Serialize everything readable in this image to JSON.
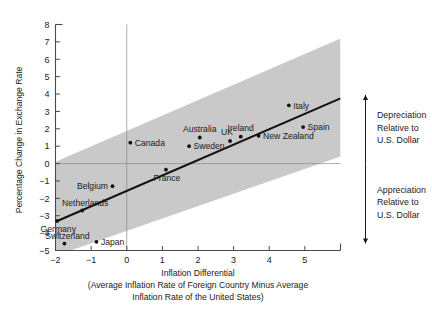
{
  "chart_data": {
    "type": "scatter",
    "title": "",
    "xlabel": "Inflation Differential",
    "xlabel_sub_line1": "(Average Inflation Rate of Foreign Country Minus Average",
    "xlabel_sub_line2": "Inflation Rate of the United States)",
    "ylabel": "Percentage Change in Exchange Rate",
    "xlim": [
      -2,
      6
    ],
    "ylim": [
      -5,
      8
    ],
    "xticks": [
      -2,
      -1,
      0,
      1,
      2,
      3,
      4,
      5
    ],
    "xtick_labels": [
      "−2",
      "−1",
      "0",
      "1",
      "2",
      "3",
      "4",
      "5"
    ],
    "yticks": [
      -5,
      -4,
      -3,
      -2,
      -1,
      0,
      1,
      2,
      3,
      4,
      5,
      6,
      7,
      8
    ],
    "ytick_labels": [
      "−5",
      "−4",
      "−3",
      "−2",
      "−1",
      "0",
      "1",
      "2",
      "3",
      "4",
      "5",
      "6",
      "7",
      "8"
    ],
    "grid": false,
    "zero_lines": true,
    "points": [
      {
        "label": "Canada",
        "x": 0.1,
        "y": 1.2,
        "label_pos": "right"
      },
      {
        "label": "Australia",
        "x": 2.05,
        "y": 1.5,
        "label_pos": "above"
      },
      {
        "label": "Sweden",
        "x": 1.75,
        "y": 1.0,
        "label_pos": "right"
      },
      {
        "label": "UK",
        "x": 2.9,
        "y": 1.3,
        "label_pos": "above-left"
      },
      {
        "label": "Ireland",
        "x": 3.2,
        "y": 1.55,
        "label_pos": "above"
      },
      {
        "label": "New Zealand",
        "x": 3.7,
        "y": 1.6,
        "label_pos": "right"
      },
      {
        "label": "Spain",
        "x": 4.95,
        "y": 2.1,
        "label_pos": "right"
      },
      {
        "label": "Italy",
        "x": 4.55,
        "y": 3.35,
        "label_pos": "right"
      },
      {
        "label": "France",
        "x": 1.1,
        "y": -0.35,
        "label_pos": "below-right"
      },
      {
        "label": "Belgium",
        "x": -0.4,
        "y": -1.3,
        "label_pos": "left"
      },
      {
        "label": "Netherlands",
        "x": -1.25,
        "y": -2.7,
        "label_pos": "above-right"
      },
      {
        "label": "Germany",
        "x": -1.95,
        "y": -3.3,
        "label_pos": "below-right"
      },
      {
        "label": "Switzerland",
        "x": -1.75,
        "y": -4.6,
        "label_pos": "above-right"
      },
      {
        "label": "Japan",
        "x": -0.85,
        "y": -4.5,
        "label_pos": "right"
      }
    ],
    "trend_line": {
      "x1": -2,
      "y1": -3.35,
      "x2": 6,
      "y2": 3.75
    },
    "band": {
      "upper": {
        "x1": -2,
        "y1": 0.1,
        "x2": 6,
        "y2": 7.2
      },
      "lower": {
        "x1": -2,
        "y1": -5.3,
        "x2": 6,
        "y2": 0.4
      },
      "color": "#c9c9c9"
    },
    "annotations": [
      {
        "name": "depreciation",
        "lines": [
          "Depreciation",
          "Relative to",
          "U.S. Dollar"
        ],
        "range_y": [
          0,
          3.95
        ],
        "arrow": "up"
      },
      {
        "name": "appreciation",
        "lines": [
          "Appreciation",
          "Relative to",
          "U.S. Dollar"
        ],
        "range_y": [
          -4.6,
          0
        ],
        "arrow": "down"
      }
    ]
  },
  "colors": {
    "background": "#ffffff",
    "page": "#e9e9e9",
    "axis": "#4a4a4a",
    "text": "#1a1a1a",
    "band": "#c9c9c9",
    "trend": "#111111",
    "point": "#111111",
    "zero_line": "#8a8a8a"
  }
}
